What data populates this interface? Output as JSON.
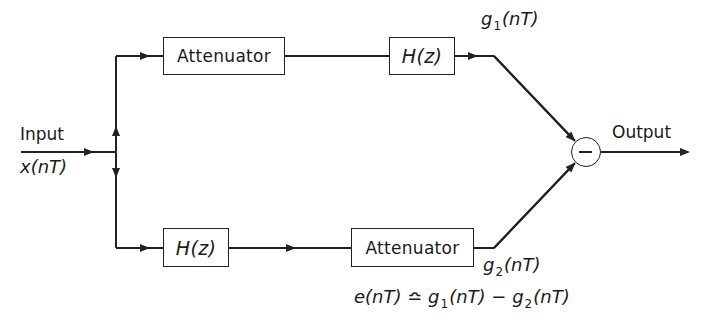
{
  "diagram": {
    "type": "block-diagram",
    "input": {
      "label": "Input",
      "signal": "x(nT)"
    },
    "output": {
      "label": "Output"
    },
    "top_path": {
      "blocks": [
        {
          "id": "top-attenuator",
          "label": "Attenuator"
        },
        {
          "id": "top-hz",
          "label": "H(z)"
        }
      ],
      "output_signal": {
        "base": "g",
        "sub": "1",
        "rest": "(nT)"
      }
    },
    "bottom_path": {
      "blocks": [
        {
          "id": "bottom-hz",
          "label": "H(z)"
        },
        {
          "id": "bottom-attenuator",
          "label": "Attenuator"
        }
      ],
      "output_signal": {
        "base": "g",
        "sub": "2",
        "rest": "(nT)"
      }
    },
    "summing_junction": {
      "operation": "subtract",
      "symbol": "−"
    },
    "equation": {
      "lhs": "e(nT) ≏ ",
      "t1_base": "g",
      "t1_sub": "1",
      "t1_rest": "(nT)",
      "op": " − ",
      "t2_base": "g",
      "t2_sub": "2",
      "t2_rest": "(nT)"
    },
    "colors": {
      "line": "#222222",
      "background": "#ffffff"
    }
  }
}
